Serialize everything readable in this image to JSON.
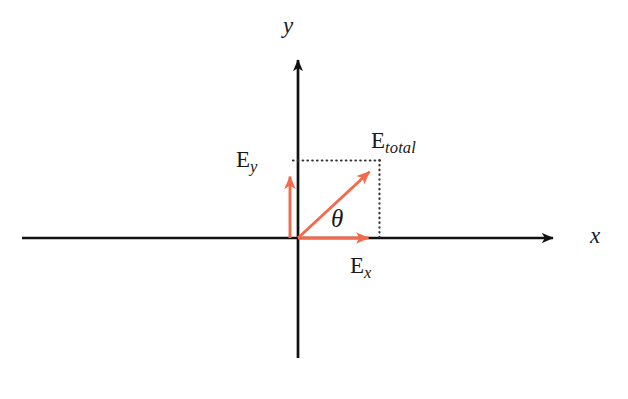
{
  "figure": {
    "kind": "vector-decomposition-diagram",
    "background_color": "#ffffff",
    "axis_color": "#111111",
    "vector_color": "#f4694b",
    "dotted_color": "#3a3a3a"
  },
  "axes": {
    "x_label": "x",
    "y_label": "y",
    "origin": {
      "x": 298,
      "y": 238
    },
    "x_start": {
      "x": 22,
      "y": 238
    },
    "x_end": {
      "x": 566,
      "y": 238
    },
    "y_start": {
      "x": 298,
      "y": 358
    },
    "y_end": {
      "x": 298,
      "y": 48
    }
  },
  "vectors": [
    {
      "id": "e-total",
      "label_main": "E",
      "label_sub": "total",
      "from": {
        "x": 298,
        "y": 238
      },
      "to": {
        "x": 379,
        "y": 163
      },
      "color": "#f4694b"
    },
    {
      "id": "e-y",
      "label_main": "E",
      "label_sub": "y",
      "from": {
        "x": 290,
        "y": 238
      },
      "to": {
        "x": 290,
        "y": 164
      },
      "color": "#f4694b"
    },
    {
      "id": "e-x",
      "label_main": "E",
      "label_sub": "x",
      "from": {
        "x": 298,
        "y": 238
      },
      "to": {
        "x": 381,
        "y": 238
      },
      "color": "#f4694b"
    }
  ],
  "angle": {
    "symbol": "θ",
    "between": [
      "x-axis",
      "e-total"
    ]
  },
  "guides": [
    {
      "id": "horizontal-guide",
      "from": {
        "x": 293,
        "y": 160
      },
      "to": {
        "x": 380,
        "y": 160
      }
    },
    {
      "id": "vertical-guide",
      "from": {
        "x": 379,
        "y": 160
      },
      "to": {
        "x": 379,
        "y": 238
      }
    }
  ]
}
